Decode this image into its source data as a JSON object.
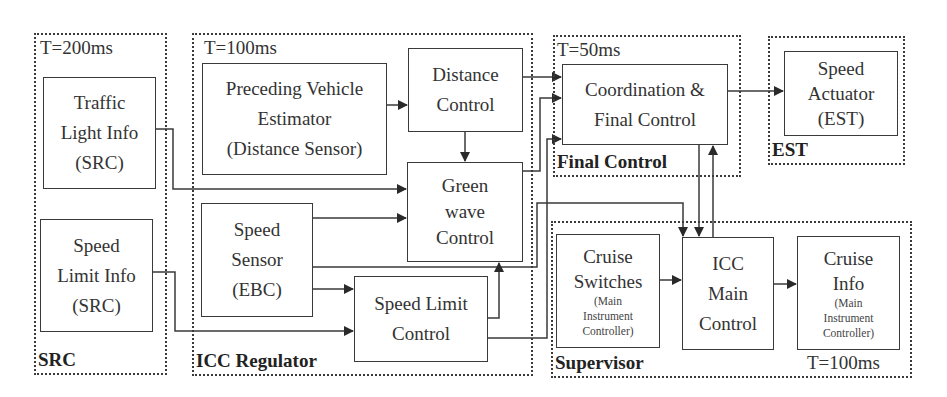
{
  "diagram": {
    "groups": {
      "src": {
        "label": "SRC",
        "period": "T=200ms"
      },
      "icc_regulator": {
        "label": "ICC Regulator",
        "period": "T=100ms"
      },
      "final_control": {
        "label": "Final Control",
        "period": "T=50ms"
      },
      "est": {
        "label": "EST"
      },
      "supervisor": {
        "label": "Supervisor",
        "period": "T=100ms"
      }
    },
    "blocks": {
      "traffic_light_info": {
        "lines": [
          "Traffic",
          "Light Info",
          "(SRC)"
        ]
      },
      "speed_limit_info": {
        "lines": [
          "Speed",
          "Limit Info",
          "(SRC)"
        ]
      },
      "preceding_vehicle_estimator": {
        "lines": [
          "Preceding Vehicle",
          "Estimator",
          "(Distance Sensor)"
        ]
      },
      "distance_control": {
        "lines": [
          "Distance",
          "Control"
        ]
      },
      "green_wave_control": {
        "lines": [
          "Green",
          "wave",
          "Control"
        ]
      },
      "speed_sensor": {
        "lines": [
          "Speed",
          "Sensor",
          "(EBC)"
        ]
      },
      "speed_limit_control": {
        "lines": [
          "Speed Limit",
          "Control"
        ]
      },
      "coordination_final_control": {
        "lines": [
          "Coordination &",
          "Final Control"
        ]
      },
      "speed_actuator": {
        "lines": [
          "Speed",
          "Actuator",
          "(EST)"
        ]
      },
      "cruise_switches": {
        "lines": [
          "Cruise",
          "Switches"
        ],
        "sub": [
          "(Main",
          "Instrument",
          "Controller)"
        ]
      },
      "icc_main_control": {
        "lines": [
          "ICC",
          "Main",
          "Control"
        ]
      },
      "cruise_info": {
        "lines": [
          "Cruise",
          "Info"
        ],
        "sub": [
          "(Main",
          "Instrument",
          "Controller)"
        ]
      }
    },
    "colors": {
      "stroke": "#3a3a3a",
      "background": "#ffffff"
    }
  }
}
